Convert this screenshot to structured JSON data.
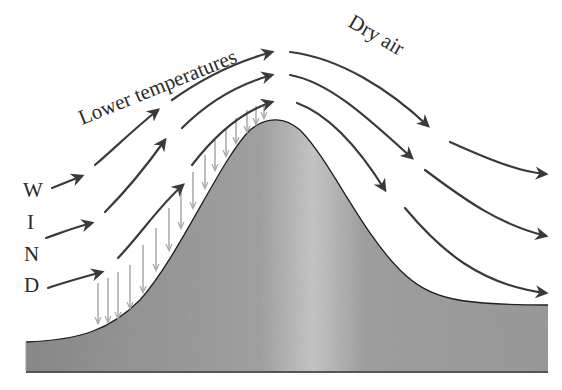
{
  "diagram": {
    "type": "orographic-lift",
    "labels": {
      "upwind": "Lower temperatures",
      "downwind": "Dry air",
      "wind_letters": [
        "W",
        "I",
        "N",
        "D"
      ]
    },
    "colors": {
      "mountain_fill": "#9a9a9a",
      "mountain_highlight": "#c4c4c4",
      "outline": "#1e1e1e",
      "wind_arrow": "#3a3a3a",
      "rain_arrow": "#a8a8a8",
      "background": "#ffffff"
    }
  }
}
